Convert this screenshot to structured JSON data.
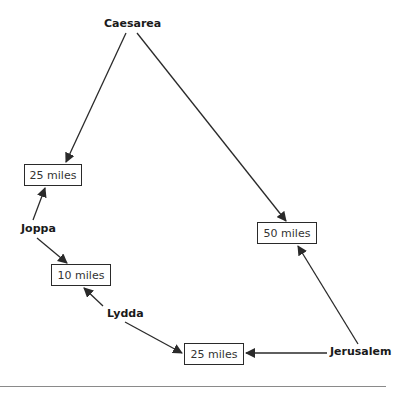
{
  "diagram": {
    "colors": {
      "line": "#2a2a2a",
      "text": "#1a1a1a",
      "rule": "#8a8a8a",
      "background": "#ffffff"
    },
    "cities": [
      {
        "id": "caesarea",
        "label": "Caesarea"
      },
      {
        "id": "joppa",
        "label": "Joppa"
      },
      {
        "id": "lydda",
        "label": "Lydda"
      },
      {
        "id": "jerusalem",
        "label": "Jerusalem"
      }
    ],
    "distances": [
      {
        "id": "caesarea-joppa",
        "label": "25 miles"
      },
      {
        "id": "joppa-lydda",
        "label": "10 miles"
      },
      {
        "id": "caesarea-jerusalem",
        "label": "50 miles"
      },
      {
        "id": "lydda-jerusalem",
        "label": "25 miles"
      }
    ]
  }
}
